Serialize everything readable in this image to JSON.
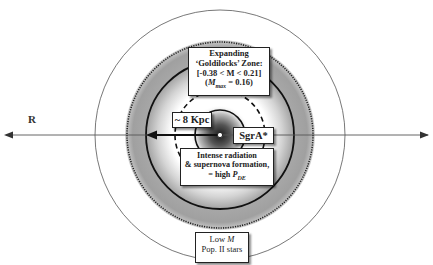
{
  "diagram": {
    "axis_label": "R",
    "center_label": "SgrA*",
    "distance_label": "~ 8 Kpc",
    "goldilocks": {
      "line1": "Expanding",
      "line2": "‘Goldilocks’ Zone:",
      "line3": "[-0.38 < M < 0.21]",
      "line4_prefix": "(",
      "line4_var": "M",
      "line4_sub": "max",
      "line4_suffix": " = 0.16)"
    },
    "intense": {
      "line1": "Intense radiation",
      "line2": "& supernova formation,",
      "line3_prefix": "= high ",
      "line3_var": "P",
      "line3_sub": "DE"
    },
    "low_m": {
      "line1_prefix": "Low ",
      "line1_var": "M",
      "line2": "Pop. II stars"
    },
    "colors": {
      "ring_gray": "#a6a6a6",
      "line": "#222222",
      "thin_line": "#555555"
    }
  }
}
